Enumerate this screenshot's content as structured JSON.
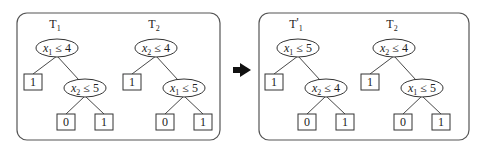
{
  "diagram": {
    "type": "tree-transformation",
    "arrow": {
      "direction": "right",
      "color": "#111111"
    },
    "panels": [
      {
        "id": "before",
        "trees": [
          {
            "label": {
              "main": "T",
              "sub": "1",
              "prime": ""
            },
            "root": {
              "var": "x",
              "var_sub": "1",
              "op": "≤",
              "value": "4"
            },
            "left_leaf": "1",
            "right_node": {
              "var": "x",
              "var_sub": "2",
              "op": "≤",
              "value": "5"
            },
            "right_leaves": [
              "0",
              "1"
            ]
          },
          {
            "label": {
              "main": "T",
              "sub": "2",
              "prime": ""
            },
            "root": {
              "var": "x",
              "var_sub": "2",
              "op": "≤",
              "value": "4"
            },
            "left_leaf": "1",
            "right_node": {
              "var": "x",
              "var_sub": "1",
              "op": "≤",
              "value": "5"
            },
            "right_leaves": [
              "0",
              "1"
            ]
          }
        ]
      },
      {
        "id": "after",
        "trees": [
          {
            "label": {
              "main": "T",
              "sub": "1",
              "prime": "'"
            },
            "root": {
              "var": "x",
              "var_sub": "1",
              "op": "≤",
              "value": "5"
            },
            "left_leaf": "1",
            "right_node": {
              "var": "x",
              "var_sub": "2",
              "op": "≤",
              "value": "4"
            },
            "right_leaves": [
              "0",
              "1"
            ]
          },
          {
            "label": {
              "main": "T",
              "sub": "2",
              "prime": ""
            },
            "root": {
              "var": "x",
              "var_sub": "2",
              "op": "≤",
              "value": "4"
            },
            "left_leaf": "1",
            "right_node": {
              "var": "x",
              "var_sub": "1",
              "op": "≤",
              "value": "5"
            },
            "right_leaves": [
              "0",
              "1"
            ]
          }
        ]
      }
    ]
  }
}
